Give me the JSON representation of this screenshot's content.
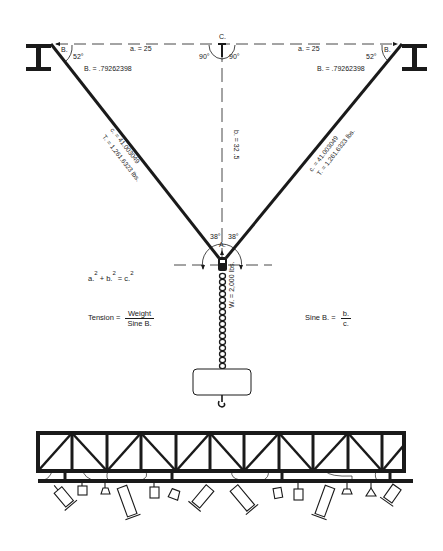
{
  "diagram": {
    "type": "rigging bridle tension diagram",
    "points": {
      "corner_b_left": "B.",
      "corner_b_right": "B.",
      "corner_c": "C.",
      "corner_a": "A."
    },
    "angles": {
      "b_left": "52°",
      "b_right": "52°",
      "c_left": "90°",
      "c_right": "90°",
      "a_left": "38°",
      "a_right": "38°"
    },
    "dimensions": {
      "a_left": "a. = 25",
      "a_right": "a. = 25",
      "b": "b. = 32 .5",
      "c_left": "c. = 41.003049",
      "c_right": "c. = 41.003049",
      "t_left": "T. = 1,261.6323 lbs.",
      "t_right": "T. = 1,261.6323 lbs.",
      "b_sine_left": "B. = .79262398",
      "b_sine_right": "B. = .79262398",
      "weight": "W. = 2,000 lbs."
    },
    "formulas": {
      "pythagoras": {
        "a": "a.",
        "b": "+ b.",
        "c": "= c.",
        "exp": "2"
      },
      "tension": {
        "lhs": "Tension =",
        "num": "Weight",
        "den": "Sine B."
      },
      "sine": {
        "lhs": "Sine B. =",
        "num": "b.",
        "den": "c."
      }
    },
    "colors": {
      "ink": "#1a1a1a",
      "paper": "#ffffff"
    }
  }
}
